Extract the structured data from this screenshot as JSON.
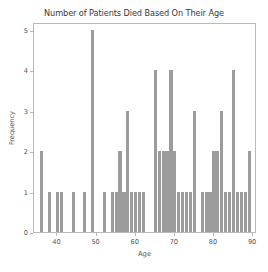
{
  "chart_data": {
    "type": "bar",
    "title": "Number of Patients Died Based On Their Age",
    "xlabel": "Age",
    "ylabel": "Frequency",
    "xlim": [
      34,
      91
    ],
    "ylim": [
      0,
      5.2
    ],
    "grid": false,
    "legend": null,
    "bar_color": "#9c9c9c",
    "xticks": [
      40,
      50,
      60,
      70,
      80,
      90
    ],
    "yticks": [
      0,
      1,
      2,
      3,
      4,
      5
    ],
    "x": [
      36,
      38,
      40,
      41,
      44,
      47,
      49,
      52,
      54,
      55,
      56,
      57,
      58,
      59,
      60,
      61,
      62,
      65,
      66,
      67,
      68,
      69,
      70,
      71,
      72,
      73,
      74,
      75,
      77,
      78,
      79,
      80,
      81,
      82,
      83,
      84,
      85,
      86,
      87,
      88,
      89
    ],
    "values": [
      2,
      1,
      1,
      1,
      1,
      1,
      5,
      1,
      1,
      1,
      2,
      1,
      3,
      1,
      1,
      1,
      1,
      4,
      2,
      2,
      2,
      4,
      2,
      1,
      1,
      1,
      1,
      3,
      1,
      1,
      1,
      2,
      2,
      3,
      1,
      1,
      4,
      1,
      1,
      1,
      2
    ],
    "categories": [
      "36",
      "38",
      "40",
      "41",
      "44",
      "47",
      "49",
      "52",
      "54",
      "55",
      "56",
      "57",
      "58",
      "59",
      "60",
      "61",
      "62",
      "65",
      "66",
      "67",
      "68",
      "69",
      "70",
      "71",
      "72",
      "73",
      "74",
      "75",
      "77",
      "78",
      "79",
      "80",
      "81",
      "82",
      "83",
      "84",
      "85",
      "86",
      "87",
      "88",
      "89"
    ]
  }
}
